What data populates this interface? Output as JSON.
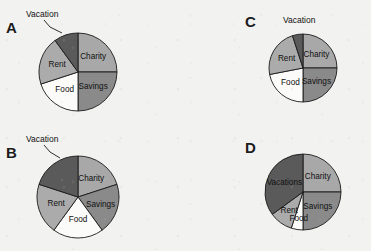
{
  "figure": {
    "background_color": "#f2f2f0",
    "width": 371,
    "height": 251,
    "outline_color": "#1a1a1a"
  },
  "palette": {
    "charity": "#a8a8a8",
    "savings": "#8a8a8a",
    "food": "#fbfbf9",
    "rent": "#ababab",
    "vacation": "#5a5a5a",
    "outline": "#1a1a1a",
    "text": "#111111"
  },
  "panels": [
    {
      "letter": "A",
      "letter_x": 6,
      "letter_y": 20,
      "cx": 78,
      "cy": 72,
      "r": 39,
      "callout": {
        "text": "Vacation",
        "x": 26,
        "y": 10,
        "leader": "M 44 20 L 50 27 L 62 33"
      },
      "slices": [
        {
          "name": "Charity",
          "label": "Charity",
          "value": 25,
          "start": 0,
          "end": 90,
          "color_key": "charity",
          "label_r": 0.55
        },
        {
          "name": "Savings",
          "label": "Savings",
          "value": 25,
          "start": 90,
          "end": 180,
          "color_key": "savings",
          "label_r": 0.55
        },
        {
          "name": "Food",
          "label": "Food",
          "value": 20,
          "start": 180,
          "end": 252,
          "color_key": "food",
          "label_r": 0.58
        },
        {
          "name": "Rent",
          "label": "Rent",
          "value": 20,
          "start": 252,
          "end": 324,
          "color_key": "rent",
          "label_r": 0.56
        },
        {
          "name": "Vacation",
          "label": "",
          "value": 10,
          "start": 324,
          "end": 360,
          "color_key": "vacation",
          "label_r": 0.6
        }
      ]
    },
    {
      "letter": "B",
      "letter_x": 6,
      "letter_y": 145,
      "cx": 78,
      "cy": 197,
      "r": 41,
      "callout": {
        "text": "Vacation",
        "x": 26,
        "y": 135,
        "leader": "M 44 145 L 50 152 L 60 158"
      },
      "slices": [
        {
          "name": "Charity",
          "label": "Charity",
          "value": 20,
          "start": 0,
          "end": 72,
          "color_key": "charity",
          "label_r": 0.55
        },
        {
          "name": "Savings",
          "label": "Savings",
          "value": 20,
          "start": 72,
          "end": 144,
          "color_key": "savings",
          "label_r": 0.58
        },
        {
          "name": "Food",
          "label": "Food",
          "value": 20,
          "start": 144,
          "end": 216,
          "color_key": "food",
          "label_r": 0.56
        },
        {
          "name": "Rent",
          "label": "Rent",
          "value": 20,
          "start": 216,
          "end": 288,
          "color_key": "rent",
          "label_r": 0.56
        },
        {
          "name": "Vacation",
          "label": "",
          "value": 20,
          "start": 288,
          "end": 360,
          "color_key": "vacation",
          "label_r": 0.6
        }
      ]
    },
    {
      "letter": "C",
      "letter_x": 245,
      "letter_y": 14,
      "cx": 303,
      "cy": 68,
      "r": 34,
      "callout": {
        "text": "Vacation",
        "x": 283,
        "y": 16,
        "leader": ""
      },
      "slices": [
        {
          "name": "Charity",
          "label": "Charity",
          "value": 25,
          "start": 0,
          "end": 90,
          "color_key": "charity",
          "label_r": 0.56
        },
        {
          "name": "Savings",
          "label": "Savings",
          "value": 25,
          "start": 90,
          "end": 180,
          "color_key": "savings",
          "label_r": 0.56
        },
        {
          "name": "Food",
          "label": "Food",
          "value": 22,
          "start": 180,
          "end": 259,
          "color_key": "food",
          "label_r": 0.58
        },
        {
          "name": "Rent",
          "label": "Rent",
          "value": 23,
          "start": 259,
          "end": 342,
          "color_key": "rent",
          "label_r": 0.56
        },
        {
          "name": "Vacation",
          "label": "",
          "value": 5,
          "start": 342,
          "end": 360,
          "color_key": "vacation",
          "label_r": 0.6
        }
      ]
    },
    {
      "letter": "D",
      "letter_x": 245,
      "letter_y": 140,
      "cx": 303,
      "cy": 192,
      "r": 38,
      "callout": null,
      "slices": [
        {
          "name": "Charity",
          "label": "Charity",
          "value": 25,
          "start": 0,
          "end": 90,
          "color_key": "charity",
          "label_r": 0.55
        },
        {
          "name": "Savings",
          "label": "Savings",
          "value": 25,
          "start": 90,
          "end": 180,
          "color_key": "savings",
          "label_r": 0.55
        },
        {
          "name": "Food",
          "label": "Food",
          "value": 5,
          "start": 180,
          "end": 198,
          "color_key": "food",
          "label_r": 0.72
        },
        {
          "name": "Rent",
          "label": "Rent",
          "value": 10,
          "start": 198,
          "end": 234,
          "color_key": "rent",
          "label_r": 0.62
        },
        {
          "name": "Vacations",
          "label": "Vacations",
          "value": 35,
          "start": 234,
          "end": 360,
          "color_key": "vacation",
          "label_r": 0.55
        }
      ]
    }
  ],
  "chart_data": {
    "type": "pie",
    "title": "",
    "note": "Four budget pie charts labelled A, B, C and D. Each pie has the categories Charity, Savings, Food, Rent and Vacation. Slice percentages are estimated from the drawn wedge angles.",
    "legend_position": "none",
    "categories": [
      "Charity",
      "Savings",
      "Food",
      "Rent",
      "Vacation"
    ],
    "series": [
      {
        "name": "A",
        "values": [
          25,
          25,
          20,
          20,
          10
        ]
      },
      {
        "name": "B",
        "values": [
          20,
          20,
          20,
          20,
          20
        ]
      },
      {
        "name": "C",
        "values": [
          25,
          25,
          22,
          23,
          5
        ]
      },
      {
        "name": "D",
        "values": [
          25,
          25,
          5,
          10,
          35
        ]
      }
    ],
    "units": "percent"
  }
}
